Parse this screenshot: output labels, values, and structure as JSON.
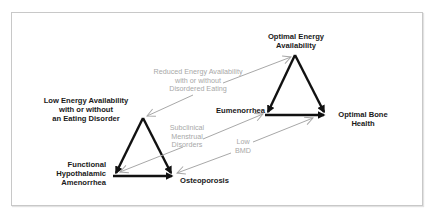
{
  "diagram": {
    "type": "two-triad comparison",
    "colors": {
      "strong_arrow": "#111111",
      "transition_arrow": "#a8a8a8",
      "frame_border": "#c8c8c8",
      "label_text": "#1a1a1a",
      "transition_text": "#a8a8a8"
    },
    "healthy_triad": {
      "top": "Optimal Energy\nAvailability",
      "left": "Eumenorrhea",
      "right": "Optimal Bone\nHealth"
    },
    "unhealthy_triad": {
      "top": "Low Energy Availability\nwith or without\nan Eating Disorder",
      "left": "Functional\nHypothalamic\nAmenorrhea",
      "right": "Osteoporosis"
    },
    "transitions": [
      {
        "label": "Reduced Energy Availability\nwith or without\nDisordered Eating",
        "from": "Optimal Energy Availability",
        "to": "Low Energy Availability with or without an Eating Disorder",
        "bidirectional": true
      },
      {
        "label": "Subclinical\nMenstrual\nDisorders",
        "from": "Eumenorrhea",
        "to": "Functional Hypothalamic Amenorrhea",
        "bidirectional": true
      },
      {
        "label": "Low\nBMD",
        "from": "Optimal Bone Health",
        "to": "Osteoporosis",
        "bidirectional": true
      }
    ]
  }
}
